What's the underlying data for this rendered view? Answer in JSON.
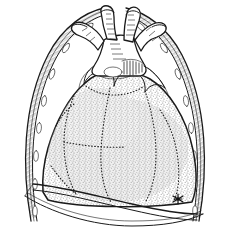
{
  "figure": {
    "title": "Anterior view of the thorax showing the heart in situ",
    "type": "anatomical-line-drawing",
    "medium": "pen-and-ink stipple drawing",
    "background_color": "#ffffff",
    "ink_color": "#1a1a1a",
    "stipple_color": "#8a8a8a",
    "width_px": 230,
    "height_px": 234
  },
  "structures": [
    {
      "id": "left-chest-wall",
      "label": "left thoracic wall",
      "rendering": "double outline with cross-hatched band and oval rib-interval markings",
      "side": "left"
    },
    {
      "id": "right-chest-wall",
      "label": "right thoracic wall",
      "rendering": "double outline with cross-hatched band and oval rib-interval markings",
      "side": "right"
    },
    {
      "id": "heart-silhouette",
      "label": "heart",
      "rendering": "stippled grey mass with solid outline",
      "chamber_borders": "dotted"
    },
    {
      "id": "great-vessels",
      "label": "great vessels",
      "rendering": "cut tubular trunks branching at the superior mediastinum",
      "count": 4
    },
    {
      "id": "hatched-node",
      "label": "hatched structure at vessel root",
      "rendering": "fine parallel hatch lines"
    },
    {
      "id": "diaphragm",
      "label": "diaphragm",
      "rendering": "sweeping double curve across the inferior thorax"
    },
    {
      "id": "apex-marker",
      "label": "apex marker",
      "rendering": "small dark asterisk-like mark",
      "position": "lower right of heart"
    }
  ],
  "legend": {
    "visible": false,
    "entries": []
  },
  "annotations": {
    "visible_text": [],
    "markers": [
      {
        "name": "asterisk",
        "glyph": "*",
        "x": 178,
        "y": 199
      }
    ]
  }
}
